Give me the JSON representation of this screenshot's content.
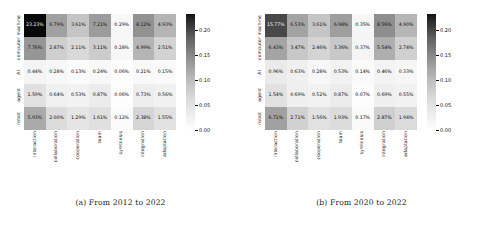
{
  "figure": {
    "panels": [
      {
        "id": "panel-a",
        "caption": "(a) From 2012 to 2022",
        "colorbar": {
          "ticks": [
            "0.20",
            "0.15",
            "0.10",
            "0.05",
            "0.00"
          ],
          "vmin": 0.0,
          "vmax": 0.2323
        },
        "chart_data": {
          "type": "heatmap",
          "title": "(a) From 2012 to 2022",
          "xlabel": "",
          "ylabel": "",
          "categories": [
            "interaction",
            "collaboration",
            "cooperation",
            "team",
            "symbiosis",
            "integration",
            "adaptation"
          ],
          "rows": [
            "machine",
            "computer",
            "AI",
            "agent",
            "robot"
          ],
          "cbar_ticks": [
            0.0,
            0.05,
            0.1,
            0.15,
            0.2
          ],
          "cbar_range": [
            0.0,
            0.2323
          ],
          "grid": false,
          "values": [
            [
              0.2323,
              0.0679,
              0.0361,
              0.0721,
              0.0029,
              0.0812,
              0.0493
            ],
            [
              0.0776,
              0.0287,
              0.0211,
              0.0311,
              0.0028,
              0.0499,
              0.0251
            ],
            [
              0.0044,
              0.0028,
              0.0013,
              0.0024,
              0.0006,
              0.0021,
              0.0015
            ],
            [
              0.0159,
              0.0064,
              0.0053,
              0.0087,
              0.0006,
              0.0073,
              0.0056
            ],
            [
              0.0593,
              0.02,
              0.0129,
              0.0161,
              0.0012,
              0.0238,
              0.0155
            ]
          ],
          "labels": [
            [
              "23.23%",
              "6.79%",
              "3.61%",
              "7.21%",
              "0.29%",
              "8.12%",
              "4.93%"
            ],
            [
              "7.76%",
              "2.87%",
              "2.11%",
              "3.11%",
              "0.28%",
              "4.99%",
              "2.51%"
            ],
            [
              "0.44%",
              "0.28%",
              "0.13%",
              "0.24%",
              "0.06%",
              "0.21%",
              "0.15%"
            ],
            [
              "1.59%",
              "0.64%",
              "0.53%",
              "0.87%",
              "0.06%",
              "0.73%",
              "0.56%"
            ],
            [
              "5.93%",
              "2.00%",
              "1.29%",
              "1.61%",
              "0.12%",
              "2.38%",
              "1.55%"
            ]
          ]
        }
      },
      {
        "id": "panel-b",
        "caption": "(b) From 2020 to 2022",
        "colorbar": {
          "ticks": [
            "0.20",
            "0.15",
            "0.10",
            "0.05",
            "0.00"
          ],
          "vmin": 0.0,
          "vmax": 0.1577
        },
        "chart_data": {
          "type": "heatmap",
          "title": "(b) From 2020 to 2022",
          "xlabel": "",
          "ylabel": "",
          "categories": [
            "interaction",
            "collaboration",
            "cooperation",
            "team",
            "symbiosis",
            "integration",
            "adaptation"
          ],
          "rows": [
            "machine",
            "computer",
            "AI",
            "agent",
            "robot"
          ],
          "cbar_ticks": [
            0.0,
            0.05,
            0.1,
            0.15,
            0.2
          ],
          "cbar_range": [
            0.0,
            0.2323
          ],
          "grid": false,
          "values": [
            [
              0.1577,
              0.0653,
              0.0361,
              0.0698,
              0.0035,
              0.0856,
              0.049
            ],
            [
              0.0643,
              0.0347,
              0.0246,
              0.0336,
              0.0037,
              0.0554,
              0.0274
            ],
            [
              0.0096,
              0.0063,
              0.0028,
              0.0053,
              0.0014,
              0.0046,
              0.0033
            ],
            [
              0.0154,
              0.0069,
              0.0052,
              0.0087,
              0.0007,
              0.0069,
              0.0055
            ],
            [
              0.0671,
              0.0271,
              0.0156,
              0.0193,
              0.0017,
              0.0287,
              0.0194
            ]
          ],
          "labels": [
            [
              "15.77%",
              "6.53%",
              "3.61%",
              "6.98%",
              "0.35%",
              "8.56%",
              "4.90%"
            ],
            [
              "6.43%",
              "3.47%",
              "2.46%",
              "3.36%",
              "0.37%",
              "5.54%",
              "2.74%"
            ],
            [
              "0.96%",
              "0.63%",
              "0.28%",
              "0.53%",
              "0.14%",
              "0.46%",
              "0.33%"
            ],
            [
              "1.54%",
              "0.69%",
              "0.52%",
              "0.87%",
              "0.07%",
              "0.69%",
              "0.55%"
            ],
            [
              "6.71%",
              "2.71%",
              "1.56%",
              "1.93%",
              "0.17%",
              "2.87%",
              "1.94%"
            ]
          ]
        }
      }
    ]
  }
}
